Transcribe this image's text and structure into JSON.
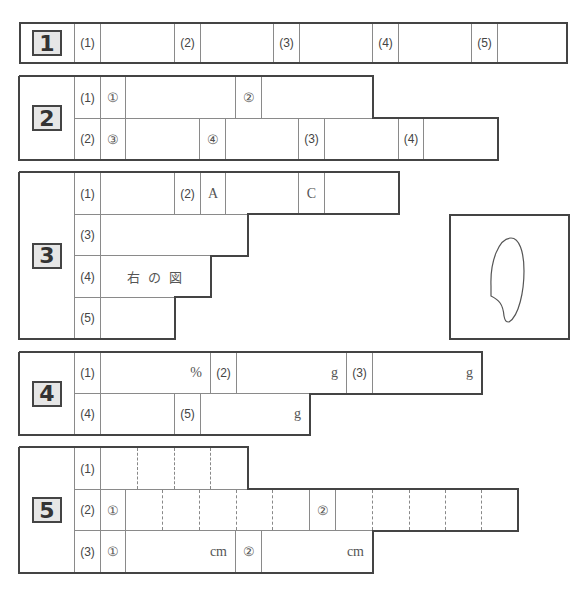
{
  "top_note": "",
  "section1": {
    "number": "1",
    "labels": [
      "(1)",
      "(2)",
      "(3)",
      "(4)",
      "(5)"
    ],
    "answers": [
      "",
      "",
      "",
      "",
      ""
    ]
  },
  "section2": {
    "number": "2",
    "row1": {
      "label": "(1)",
      "sub": [
        "①",
        "②"
      ],
      "answers": [
        "",
        ""
      ]
    },
    "row2": {
      "label": "(2)",
      "sub": [
        "③",
        "④"
      ],
      "extra": [
        "(3)",
        "(4)"
      ],
      "answers": [
        "",
        "",
        "",
        ""
      ]
    }
  },
  "section3": {
    "number": "3",
    "row1": {
      "label1": "(1)",
      "label2": "(2)",
      "sub": [
        "A",
        "C"
      ]
    },
    "row3": {
      "label": "(3)"
    },
    "row4": {
      "label": "(4)",
      "text": "右 の 図"
    },
    "row5": {
      "label": "(5)"
    },
    "figure": {
      "shape": "leaf-outline"
    }
  },
  "section4": {
    "number": "4",
    "row1": {
      "labels": [
        "(1)",
        "(2)",
        "(3)"
      ],
      "units": [
        "%",
        "g",
        "g"
      ]
    },
    "row2": {
      "labels": [
        "(4)",
        "(5)"
      ],
      "units": [
        "g"
      ]
    }
  },
  "section5": {
    "number": "5",
    "row1": {
      "label": "(1)"
    },
    "row2": {
      "label": "(2)",
      "sub": [
        "①",
        "②"
      ]
    },
    "row3": {
      "label": "(3)",
      "sub": [
        "①",
        "②"
      ],
      "units": [
        "cm",
        "cm"
      ]
    }
  }
}
